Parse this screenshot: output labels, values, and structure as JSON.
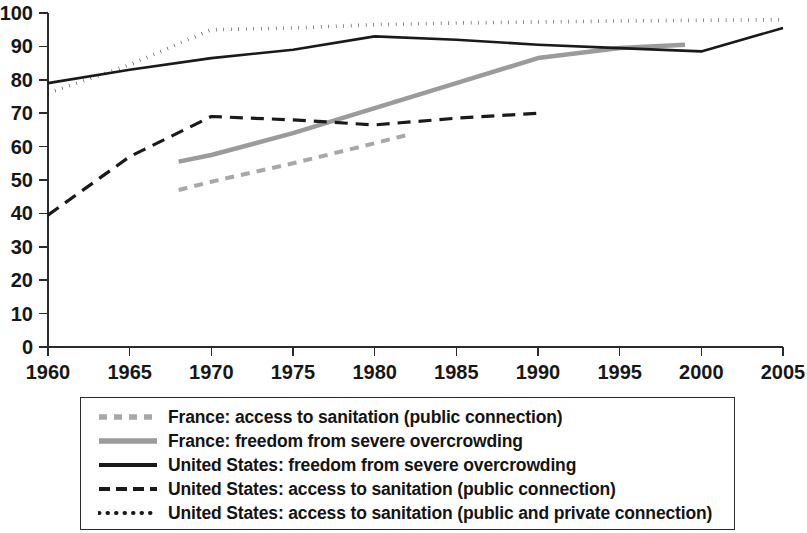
{
  "chart_data": {
    "type": "line",
    "title": "",
    "subtitle": "",
    "xlabel": "",
    "ylabel": "",
    "xlim": [
      1960,
      2005
    ],
    "ylim": [
      0,
      100
    ],
    "grid": false,
    "legend_position": "bottom",
    "x_ticks": [
      "1960",
      "1965",
      "1970",
      "1975",
      "1980",
      "1985",
      "1990",
      "1995",
      "2000",
      "2005"
    ],
    "y_ticks": [
      "0",
      "10",
      "20",
      "30",
      "40",
      "50",
      "60",
      "70",
      "80",
      "90",
      "100"
    ],
    "series": [
      {
        "name": "France: access to sanitation (public connection)",
        "style": "dashed",
        "color": "#a8a8a8",
        "width": 4,
        "dash": "9,7",
        "x": [
          1968,
          1970,
          1975,
          1980,
          1982
        ],
        "values": [
          47,
          49.5,
          55,
          61,
          63.5
        ]
      },
      {
        "name": "France: freedom from severe overcrowding",
        "style": "solid",
        "color": "#9b9b9b",
        "width": 4.5,
        "dash": "",
        "x": [
          1968,
          1970,
          1975,
          1980,
          1985,
          1990,
          1995,
          1999
        ],
        "values": [
          55.5,
          57.5,
          64,
          71.5,
          79,
          86.5,
          89.5,
          90.5
        ]
      },
      {
        "name": "United States: freedom from severe overcrowding",
        "style": "solid",
        "color": "#1a1a1a",
        "width": 2.6,
        "dash": "",
        "x": [
          1960,
          1965,
          1970,
          1975,
          1980,
          1985,
          1990,
          1995,
          2000,
          2005
        ],
        "values": [
          79,
          83,
          86.5,
          89,
          93,
          92,
          90.5,
          89.5,
          88.5,
          95.5
        ]
      },
      {
        "name": "United States: access to sanitation (public connection)",
        "style": "dashed",
        "color": "#1a1a1a",
        "width": 3.2,
        "dash": "13,8",
        "x": [
          1960,
          1965,
          1970,
          1975,
          1980,
          1985,
          1990
        ],
        "values": [
          39.5,
          57,
          69,
          68,
          66.5,
          68.5,
          70
        ]
      },
      {
        "name": "United States: access to sanitation (public and private connection)",
        "style": "dotted",
        "color": "#1a1a1a",
        "width": 3.6,
        "dash": "0.5,7",
        "x": [
          1960,
          1965,
          1970,
          1975,
          1980,
          1985,
          1990,
          1995,
          2000,
          2005
        ],
        "values": [
          76,
          84.5,
          95,
          95.5,
          96.5,
          97,
          97.3,
          97.6,
          97.8,
          98
        ]
      }
    ],
    "legend": [
      {
        "label": "France: access to sanitation (public connection)",
        "swatch": "dashed-gray-thick",
        "color": "#a8a8a8"
      },
      {
        "label": "France: freedom from severe overcrowding",
        "swatch": "solid-gray-thick",
        "color": "#9b9b9b"
      },
      {
        "label": "United States: freedom from severe overcrowding",
        "swatch": "solid-black",
        "color": "#1a1a1a"
      },
      {
        "label": "United States: access to sanitation (public connection)",
        "swatch": "dashed-black",
        "color": "#1a1a1a"
      },
      {
        "label": "United States: access to sanitation (public and private connection)",
        "swatch": "dotted-black",
        "color": "#1a1a1a"
      }
    ]
  }
}
